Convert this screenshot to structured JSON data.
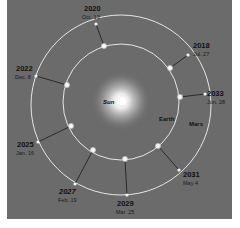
{
  "diagram": {
    "title": "",
    "center_label": "Sun",
    "orbit_labels": {
      "inner": "Earth",
      "outer": "Mars"
    },
    "colors": {
      "background": "#6b6b6b",
      "orbit": "#e6e6e6",
      "connector": "#222222",
      "sun_glow": "#ffffff",
      "text": "#111111"
    },
    "oppositions": [
      {
        "year": "2018",
        "date": "Jul. 27"
      },
      {
        "year": "2020",
        "date": "Oct. 13"
      },
      {
        "year": "2022",
        "date": "Dec. 8"
      },
      {
        "year": "2025",
        "date": "Jan. 16"
      },
      {
        "year": "2027",
        "date": "Feb. 19"
      },
      {
        "year": "2029",
        "date": "Mar. 25"
      },
      {
        "year": "2031",
        "date": "May 4"
      },
      {
        "year": "2033",
        "date": "Jun. 28"
      }
    ]
  }
}
